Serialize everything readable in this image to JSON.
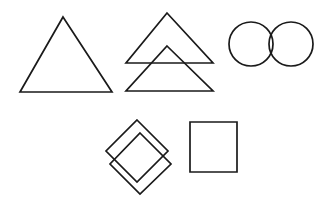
{
  "canvas": {
    "width": 336,
    "height": 208,
    "background_color": "#ffffff",
    "ink_color": "#1a1a1a",
    "stroke_width": 1.7,
    "style": "hand-drawn line art, black ink on white paper"
  },
  "figure": {
    "row_counts": [
      3,
      2
    ],
    "shape_count": 5
  },
  "shapes": [
    {
      "id": "triangle-single",
      "name": "single-triangle",
      "type": "triangle",
      "row": 1,
      "position": "top-left",
      "overlapping": false,
      "points": "63,17 112,92 20,92"
    },
    {
      "id": "triangles-overlapping",
      "name": "overlapping-triangles",
      "type": "triangle-pair",
      "row": 1,
      "position": "top-center",
      "overlapping": true,
      "parts": [
        {
          "id": "triangle-upper",
          "name": "upper-triangle",
          "points": "167,13 213,63 126,63"
        },
        {
          "id": "triangle-lower",
          "name": "lower-triangle",
          "points": "167,46 213,91 126,91"
        }
      ]
    },
    {
      "id": "circles-overlapping",
      "name": "overlapping-circles",
      "type": "circle-pair",
      "row": 1,
      "position": "top-right",
      "overlapping": true,
      "parts": [
        {
          "id": "circle-left",
          "name": "left-circle",
          "cx": 251,
          "cy": 44,
          "r": 22
        },
        {
          "id": "circle-right",
          "name": "right-circle",
          "cx": 291,
          "cy": 44,
          "r": 22
        }
      ]
    },
    {
      "id": "diamonds-overlapping",
      "name": "overlapping-diamonds",
      "type": "diamond-pair",
      "row": 2,
      "position": "bottom-left",
      "overlapping": true,
      "parts": [
        {
          "id": "diamond-upper-left",
          "name": "upper-left-diamond",
          "points": "137,120 168,151 137,182 106,151"
        },
        {
          "id": "diamond-lower-right",
          "name": "lower-right-diamond",
          "points": "140,133 171,164 140,194 110,164"
        }
      ]
    },
    {
      "id": "square-single",
      "name": "single-square",
      "type": "square",
      "row": 2,
      "position": "bottom-right",
      "overlapping": false,
      "points": "190,122 237,122 237,172 190,172"
    }
  ]
}
